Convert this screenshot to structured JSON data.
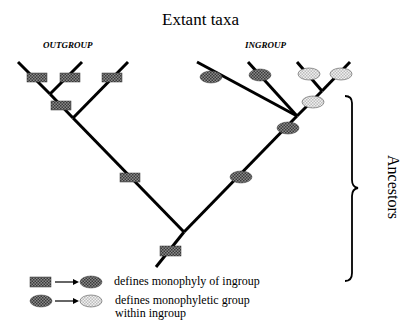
{
  "title": "Extant taxa",
  "groups": {
    "outgroup": "OUTGROUP",
    "ingroup": "INGROUP"
  },
  "bracket_label": "Ancestors",
  "legend": [
    {
      "from": "hatched-rectangle",
      "to": "dark-ellipse",
      "text": "defines monophyly of ingroup"
    },
    {
      "from": "dark-ellipse",
      "to": "light-ellipse",
      "text_line1": "defines monophyletic group",
      "text_line2": "within ingroup"
    }
  ],
  "colors": {
    "line": "#000000",
    "dark_fill": "#6a6a6a",
    "light_fill": "#e4e4e4",
    "background": "#ffffff"
  }
}
